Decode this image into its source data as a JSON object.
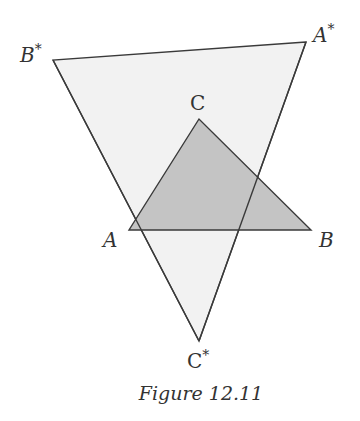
{
  "figure": {
    "caption": "Figure 12.11",
    "colors": {
      "stroke": "#3a3a3a",
      "inner_fill": "#c4c4c4",
      "outer_fill": "#f0f0f0",
      "text": "#333333"
    },
    "inner_triangle": {
      "vertices": {
        "A": {
          "label": "A",
          "x": 129,
          "y": 230
        },
        "B": {
          "label": "B",
          "x": 311,
          "y": 230
        },
        "C": {
          "label": "C",
          "x": 199,
          "y": 119
        }
      }
    },
    "outer_triangle": {
      "vertices": {
        "A_star": {
          "label": "A*",
          "x": 306,
          "y": 42
        },
        "B_star": {
          "label": "B*",
          "x": 53,
          "y": 60
        },
        "C_star": {
          "label": "C*",
          "x": 199,
          "y": 341
        }
      }
    },
    "labels": {
      "A": "A",
      "B": "B",
      "C": "C",
      "A_star": "A",
      "B_star": "B",
      "C_star": "C",
      "star": "*"
    }
  }
}
